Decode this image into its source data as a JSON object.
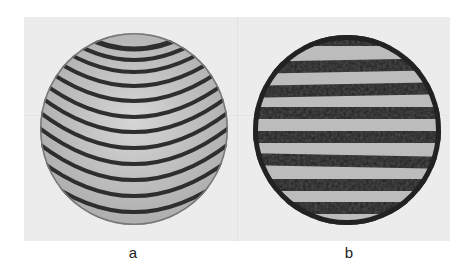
{
  "figure": {
    "panels": [
      {
        "id": "a",
        "label": "a",
        "description": "Interferogram with curved (parabolic, U-shaped) fringes",
        "fringe_type": "curved",
        "fringe_count": 16
      },
      {
        "id": "b",
        "label": "b",
        "description": "Interferogram with straight horizontal, speckled fringes",
        "fringe_type": "straight-horizontal",
        "fringe_count": 9
      }
    ],
    "colors": {
      "panel_bg": "#ececec",
      "fringe_dark": "#2a2a2a",
      "fringe_light": "#c8c8c8"
    }
  }
}
